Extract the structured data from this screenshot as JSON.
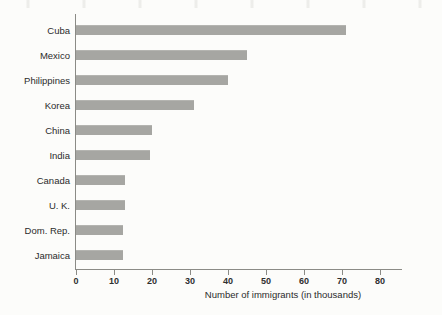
{
  "chart_data": {
    "type": "bar",
    "orientation": "horizontal",
    "title": "",
    "xlabel": "Number of immigrants (in thousands)",
    "ylabel": "",
    "xlim": [
      0,
      86
    ],
    "xticks": [
      0,
      10,
      20,
      30,
      40,
      50,
      60,
      70,
      80
    ],
    "xtick_labels": [
      "0",
      "10",
      "20",
      "30",
      "40",
      "50",
      "60",
      "70",
      "80"
    ],
    "grid": false,
    "legend": false,
    "bar_color": "#a6a6a2",
    "axis_color": "#8b8b86",
    "background_color": "#fcfcfa",
    "categories": [
      "Cuba",
      "Mexico",
      "Philippines",
      "Korea",
      "China",
      "India",
      "Canada",
      "U. K.",
      "Dom. Rep.",
      "Jamaica"
    ],
    "values": [
      71,
      45,
      40,
      31,
      20,
      19.5,
      13,
      13,
      12.4,
      12.4
    ]
  }
}
